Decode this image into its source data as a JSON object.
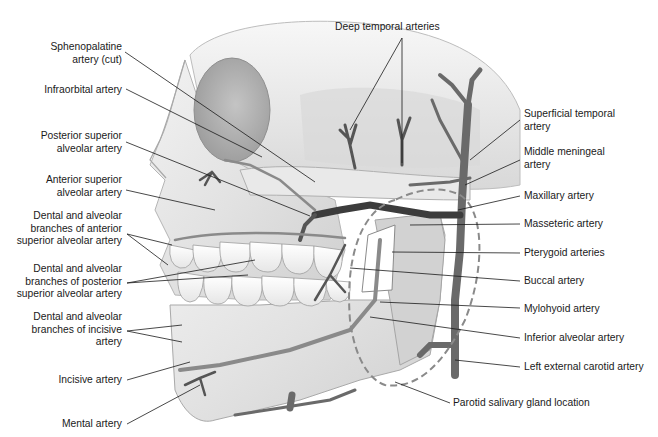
{
  "figure": {
    "colors": {
      "background": "#ffffff",
      "bone": "#e4e4e4",
      "bone_shadow": "#bdbdbd",
      "artery": "#6f6f6f",
      "artery_dark": "#3a3a3a",
      "leader": "#1a1a1a",
      "text": "#1a1a1a",
      "gland_outline": "#8a8a8a"
    }
  },
  "labels": {
    "top": [
      {
        "id": "deep-temporal",
        "lines": [
          "Deep temporal arteries"
        ]
      }
    ],
    "left": [
      {
        "id": "sphenopalatine",
        "lines": [
          "Sphenopalatine",
          "artery (cut)"
        ]
      },
      {
        "id": "infraorbital",
        "lines": [
          "Infraorbital artery"
        ]
      },
      {
        "id": "posterior-superior-alveolar",
        "lines": [
          "Posterior superior",
          "alveolar artery"
        ]
      },
      {
        "id": "anterior-superior-alveolar",
        "lines": [
          "Anterior superior",
          "alveolar artery"
        ]
      },
      {
        "id": "dental-alveolar-anterior",
        "lines": [
          "Dental and alveolar",
          "branches of anterior",
          "superior alveolar artery"
        ]
      },
      {
        "id": "dental-alveolar-posterior",
        "lines": [
          "Dental and alveolar",
          "branches of posterior",
          "superior alveolar artery"
        ]
      },
      {
        "id": "dental-alveolar-incisive",
        "lines": [
          "Dental and alveolar",
          "branches of incisive",
          "artery"
        ]
      },
      {
        "id": "incisive",
        "lines": [
          "Incisive artery"
        ]
      },
      {
        "id": "mental",
        "lines": [
          "Mental artery"
        ]
      }
    ],
    "right": [
      {
        "id": "superficial-temporal",
        "lines": [
          "Superficial temporal",
          "artery"
        ]
      },
      {
        "id": "middle-meningeal",
        "lines": [
          "Middle meningeal",
          "artery"
        ]
      },
      {
        "id": "maxillary",
        "lines": [
          "Maxillary artery"
        ]
      },
      {
        "id": "masseteric",
        "lines": [
          "Masseteric artery"
        ]
      },
      {
        "id": "pterygoid",
        "lines": [
          "Pterygoid arteries"
        ]
      },
      {
        "id": "buccal",
        "lines": [
          "Buccal artery"
        ]
      },
      {
        "id": "mylohyoid",
        "lines": [
          "Mylohyoid artery"
        ]
      },
      {
        "id": "inferior-alveolar",
        "lines": [
          "Inferior alveolar artery"
        ]
      },
      {
        "id": "left-external-carotid",
        "lines": [
          "Left external carotid artery"
        ]
      }
    ],
    "bottom": [
      {
        "id": "parotid",
        "lines": [
          "Parotid salivary gland location"
        ]
      }
    ]
  }
}
